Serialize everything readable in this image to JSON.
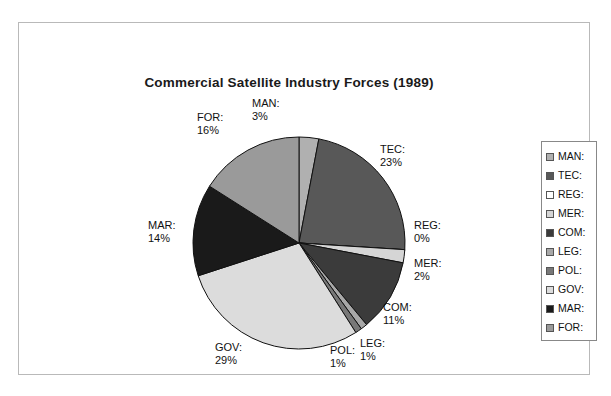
{
  "chart_data": {
    "type": "pie",
    "title": "Commercial Satellite Industry Forces (1989)",
    "categories": [
      "MAN:",
      "TEC:",
      "REG:",
      "MER:",
      "COM:",
      "LEG:",
      "POL:",
      "GOV:",
      "MAR:",
      "FOR:"
    ],
    "values": [
      3,
      23,
      0,
      2,
      11,
      1,
      1,
      29,
      14,
      16
    ],
    "value_unit": "%",
    "start_angle_deg": 0,
    "direction": "clockwise",
    "legend_position": "right",
    "grid": false,
    "slice_colors": [
      "#b0b0b0",
      "#585858",
      "#ffffff",
      "#d5d5d5",
      "#3b3b3b",
      "#a8a8a8",
      "#787878",
      "#dcdcdc",
      "#1a1a1a",
      "#9a9a9a"
    ],
    "slice_labels": [
      {
        "name": "MAN:",
        "value": "3%"
      },
      {
        "name": "TEC:",
        "value": "23%"
      },
      {
        "name": "REG:",
        "value": "0%"
      },
      {
        "name": "MER:",
        "value": "2%"
      },
      {
        "name": "COM:",
        "value": "11%"
      },
      {
        "name": "LEG:",
        "value": "1%"
      },
      {
        "name": "POL:",
        "value": "1%"
      },
      {
        "name": "GOV:",
        "value": "29%"
      },
      {
        "name": "MAR:",
        "value": "14%"
      },
      {
        "name": "FOR:",
        "value": "16%"
      }
    ]
  },
  "title": "Commercial Satellite Industry Forces (1989)",
  "labels": {
    "man": {
      "name": "MAN:",
      "value": "3%"
    },
    "tec": {
      "name": "TEC:",
      "value": "23%"
    },
    "reg": {
      "name": "REG:",
      "value": "0%"
    },
    "mer": {
      "name": "MER:",
      "value": "2%"
    },
    "com": {
      "name": "COM:",
      "value": "11%"
    },
    "leg": {
      "name": "LEG:",
      "value": "1%"
    },
    "pol": {
      "name": "POL:",
      "value": "1%"
    },
    "gov": {
      "name": "GOV:",
      "value": "29%"
    },
    "mar": {
      "name": "MAR:",
      "value": "14%"
    },
    "for": {
      "name": "FOR:",
      "value": "16%"
    }
  },
  "legend": {
    "items": [
      {
        "label": "MAN:",
        "color": "#b0b0b0"
      },
      {
        "label": "TEC:",
        "color": "#585858"
      },
      {
        "label": "REG:",
        "color": "#ffffff"
      },
      {
        "label": "MER:",
        "color": "#d5d5d5"
      },
      {
        "label": "COM:",
        "color": "#3b3b3b"
      },
      {
        "label": "LEG:",
        "color": "#a8a8a8"
      },
      {
        "label": "POL:",
        "color": "#787878"
      },
      {
        "label": "GOV:",
        "color": "#dcdcdc"
      },
      {
        "label": "MAR:",
        "color": "#1a1a1a"
      },
      {
        "label": "FOR:",
        "color": "#9a9a9a"
      }
    ]
  }
}
